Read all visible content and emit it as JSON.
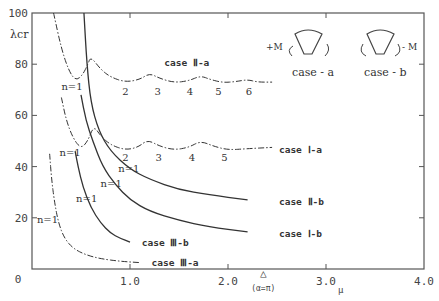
{
  "chart_data": {
    "type": "line",
    "title": "",
    "xlabel": "μ",
    "ylabel": "λcr",
    "xlim": [
      0,
      4.0
    ],
    "ylim": [
      0,
      100
    ],
    "grid": false,
    "x_ticks": [
      {
        "v": 0,
        "label": "0"
      },
      {
        "v": 1.0,
        "label": "1.0"
      },
      {
        "v": 2.0,
        "label": "2.0"
      },
      {
        "v": 3.0,
        "label": "3.0"
      },
      {
        "v": 4.0,
        "label": "4.0"
      }
    ],
    "y_ticks": [
      {
        "v": 20,
        "label": "20"
      },
      {
        "v": 40,
        "label": "40"
      },
      {
        "v": 60,
        "label": "60"
      },
      {
        "v": 80,
        "label": "80"
      },
      {
        "v": 100,
        "label": "100"
      }
    ],
    "annotation_marker": {
      "x": 2.36,
      "symbol": "△",
      "label": "(α=π)"
    },
    "series": [
      {
        "name": "case II-a",
        "label": "case Ⅱ-a",
        "style": "dashdot",
        "points": [
          [
            0.22,
            100
          ],
          [
            0.3,
            86
          ],
          [
            0.38,
            77
          ],
          [
            0.45,
            73.5
          ],
          [
            0.52,
            76
          ],
          [
            0.57,
            80
          ],
          [
            0.6,
            83
          ],
          [
            0.7,
            78
          ],
          [
            0.8,
            75
          ],
          [
            0.95,
            73
          ],
          [
            1.1,
            74
          ],
          [
            1.2,
            76.5
          ],
          [
            1.3,
            74.5
          ],
          [
            1.45,
            72.8
          ],
          [
            1.6,
            73.5
          ],
          [
            1.72,
            75.5
          ],
          [
            1.82,
            74
          ],
          [
            1.95,
            72.8
          ],
          [
            2.08,
            73.2
          ],
          [
            2.2,
            74
          ],
          [
            2.3,
            73
          ],
          [
            2.45,
            73
          ]
        ],
        "mode_labels": [
          {
            "n": "n=1",
            "x": 0.3,
            "y": 70
          },
          {
            "n": "2",
            "x": 0.92,
            "y": 68
          },
          {
            "n": "3",
            "x": 1.25,
            "y": 68
          },
          {
            "n": "4",
            "x": 1.58,
            "y": 68
          },
          {
            "n": "5",
            "x": 1.87,
            "y": 68
          },
          {
            "n": "6",
            "x": 2.18,
            "y": 68
          }
        ],
        "label_pos": [
          1.35,
          80.5
        ]
      },
      {
        "name": "case I-a",
        "label": "case Ⅰ-a",
        "style": "dashdot",
        "points": [
          [
            0.3,
            67
          ],
          [
            0.35,
            58
          ],
          [
            0.42,
            51
          ],
          [
            0.5,
            47
          ],
          [
            0.57,
            50
          ],
          [
            0.63,
            56
          ],
          [
            0.7,
            52
          ],
          [
            0.8,
            48.5
          ],
          [
            0.95,
            46.5
          ],
          [
            1.08,
            47.5
          ],
          [
            1.18,
            50.5
          ],
          [
            1.3,
            48
          ],
          [
            1.45,
            46.5
          ],
          [
            1.6,
            47.5
          ],
          [
            1.72,
            50
          ],
          [
            1.85,
            48
          ],
          [
            2.0,
            46.5
          ],
          [
            2.2,
            47
          ],
          [
            2.45,
            47.5
          ]
        ],
        "mode_labels": [
          {
            "n": "n=1",
            "x": 0.28,
            "y": 44
          },
          {
            "n": "2",
            "x": 0.92,
            "y": 42
          },
          {
            "n": "3",
            "x": 1.26,
            "y": 42
          },
          {
            "n": "4",
            "x": 1.6,
            "y": 42
          },
          {
            "n": "5",
            "x": 1.93,
            "y": 42
          }
        ],
        "label_pos": [
          2.52,
          46.5
        ]
      },
      {
        "name": "case II-b",
        "label": "case Ⅱ-b",
        "style": "solid",
        "points": [
          [
            0.53,
            100
          ],
          [
            0.56,
            80
          ],
          [
            0.6,
            65
          ],
          [
            0.68,
            54
          ],
          [
            0.8,
            46
          ],
          [
            1.0,
            39
          ],
          [
            1.2,
            35
          ],
          [
            1.5,
            31
          ],
          [
            1.8,
            29
          ],
          [
            2.2,
            27
          ]
        ],
        "mode_labels": [
          {
            "n": "n=1",
            "x": 0.88,
            "y": 38
          }
        ],
        "label_pos": [
          2.52,
          26
        ]
      },
      {
        "name": "case I-b",
        "label": "case Ⅰ-b",
        "style": "solid",
        "points": [
          [
            0.5,
            68
          ],
          [
            0.55,
            58
          ],
          [
            0.62,
            50
          ],
          [
            0.72,
            40
          ],
          [
            0.85,
            33
          ],
          [
            1.0,
            27
          ],
          [
            1.2,
            22.5
          ],
          [
            1.5,
            19
          ],
          [
            1.8,
            16.5
          ],
          [
            2.2,
            14.5
          ]
        ],
        "mode_labels": [
          {
            "n": "n=1",
            "x": 0.7,
            "y": 32
          }
        ],
        "label_pos": [
          2.52,
          13.5
        ]
      },
      {
        "name": "case III-b",
        "label": "case Ⅲ-b",
        "style": "solid",
        "points": [
          [
            0.44,
            46
          ],
          [
            0.47,
            40
          ],
          [
            0.52,
            32
          ],
          [
            0.6,
            24
          ],
          [
            0.7,
            18
          ],
          [
            0.8,
            14
          ],
          [
            0.9,
            12
          ],
          [
            1.0,
            10.5
          ]
        ],
        "mode_labels": [
          {
            "n": "n=1",
            "x": 0.45,
            "y": 26
          }
        ],
        "label_pos": [
          1.12,
          10
        ]
      },
      {
        "name": "case III-a",
        "label": "case Ⅲ-a",
        "style": "dashdot",
        "points": [
          [
            0.18,
            45
          ],
          [
            0.2,
            35
          ],
          [
            0.23,
            26
          ],
          [
            0.27,
            18
          ],
          [
            0.33,
            12
          ],
          [
            0.42,
            8
          ],
          [
            0.55,
            5.5
          ],
          [
            0.7,
            4
          ],
          [
            0.9,
            3
          ],
          [
            1.1,
            2.5
          ]
        ],
        "mode_labels": [
          {
            "n": "n=1",
            "x": 0.05,
            "y": 18
          }
        ],
        "label_pos": [
          1.22,
          2.5
        ]
      }
    ]
  },
  "axes": {
    "y_title": "λcr",
    "x_title": "μ",
    "x_origin_label": "0"
  },
  "inset": {
    "case_a": {
      "label": "case - a",
      "moment": "+M"
    },
    "case_b": {
      "label": "case - b",
      "moment": "- M"
    }
  }
}
